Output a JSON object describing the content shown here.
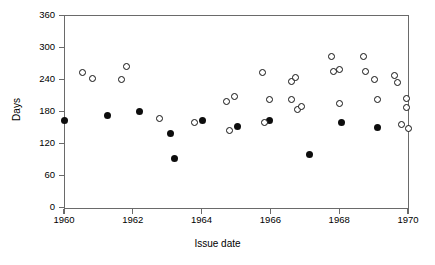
{
  "chart_data": {
    "type": "scatter",
    "title": "",
    "xlabel": "Issue date",
    "ylabel": "Days",
    "xlim": [
      1960,
      1970
    ],
    "ylim": [
      0,
      360
    ],
    "xticks": [
      1960,
      1962,
      1964,
      1966,
      1968,
      1970
    ],
    "xtick_labels": [
      "1960",
      "1962",
      "1964",
      "1966",
      "1968",
      "1970"
    ],
    "yticks": [
      0,
      60,
      120,
      180,
      240,
      300,
      360
    ],
    "ytick_labels": [
      "0",
      "60",
      "120",
      "180",
      "240",
      "300",
      "360"
    ],
    "grid": false,
    "legend": "none",
    "series": [
      {
        "name": "filled-circles",
        "marker": "filled-circle",
        "color": "#0d0d0d",
        "points": [
          {
            "x": 1960.0,
            "y": 163
          },
          {
            "x": 1961.25,
            "y": 172
          },
          {
            "x": 1962.2,
            "y": 181
          },
          {
            "x": 1963.1,
            "y": 139
          },
          {
            "x": 1963.22,
            "y": 92
          },
          {
            "x": 1964.03,
            "y": 163
          },
          {
            "x": 1965.03,
            "y": 153
          },
          {
            "x": 1965.98,
            "y": 164
          },
          {
            "x": 1967.15,
            "y": 100
          },
          {
            "x": 1968.07,
            "y": 160
          },
          {
            "x": 1969.1,
            "y": 151
          }
        ]
      },
      {
        "name": "open-circles",
        "marker": "open-circle",
        "color": "#111111",
        "points": [
          {
            "x": 1960.55,
            "y": 253
          },
          {
            "x": 1960.82,
            "y": 243
          },
          {
            "x": 1961.68,
            "y": 240
          },
          {
            "x": 1961.82,
            "y": 265
          },
          {
            "x": 1962.78,
            "y": 168
          },
          {
            "x": 1963.8,
            "y": 160
          },
          {
            "x": 1964.72,
            "y": 199
          },
          {
            "x": 1964.8,
            "y": 145
          },
          {
            "x": 1964.95,
            "y": 208
          },
          {
            "x": 1965.78,
            "y": 253
          },
          {
            "x": 1965.82,
            "y": 160
          },
          {
            "x": 1965.97,
            "y": 203
          },
          {
            "x": 1966.6,
            "y": 236
          },
          {
            "x": 1966.72,
            "y": 245
          },
          {
            "x": 1966.62,
            "y": 202
          },
          {
            "x": 1966.8,
            "y": 184
          },
          {
            "x": 1966.9,
            "y": 190
          },
          {
            "x": 1967.78,
            "y": 283
          },
          {
            "x": 1967.82,
            "y": 255
          },
          {
            "x": 1968.0,
            "y": 259
          },
          {
            "x": 1968.02,
            "y": 195
          },
          {
            "x": 1968.7,
            "y": 283
          },
          {
            "x": 1968.75,
            "y": 255
          },
          {
            "x": 1969.02,
            "y": 240
          },
          {
            "x": 1969.12,
            "y": 202
          },
          {
            "x": 1969.62,
            "y": 247
          },
          {
            "x": 1969.7,
            "y": 234
          },
          {
            "x": 1969.8,
            "y": 155
          },
          {
            "x": 1969.95,
            "y": 205
          },
          {
            "x": 1969.97,
            "y": 188
          },
          {
            "x": 1970.0,
            "y": 148
          }
        ]
      }
    ]
  }
}
